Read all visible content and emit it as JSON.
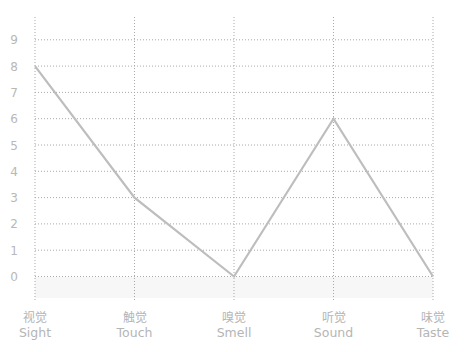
{
  "chart_data": {
    "type": "line",
    "title": "",
    "xlabel": "",
    "ylabel": "",
    "categories": [
      {
        "zh": "视觉",
        "en": "Sight"
      },
      {
        "zh": "触觉",
        "en": "Touch"
      },
      {
        "zh": "嗅觉",
        "en": "Smell"
      },
      {
        "zh": "听觉",
        "en": "Sound"
      },
      {
        "zh": "味觉",
        "en": "Taste"
      }
    ],
    "series": [
      {
        "name": "Senses",
        "values": [
          8,
          3,
          0,
          6,
          0
        ],
        "color": "#bdbdbd"
      }
    ],
    "y_ticks": [
      "0",
      "1",
      "2",
      "3",
      "4",
      "5",
      "6",
      "7",
      "8",
      "9"
    ],
    "ylim": [
      -0.8,
      9.8
    ],
    "grid": true,
    "grid_style": "dotted",
    "legend": "none",
    "band_below_zero_color": "#f7f7f7"
  }
}
